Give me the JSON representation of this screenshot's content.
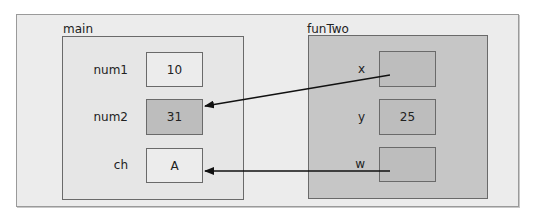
{
  "frames": {
    "main": {
      "title": "main",
      "vars": [
        {
          "name": "num1",
          "value": "10"
        },
        {
          "name": "num2",
          "value": "31"
        },
        {
          "name": "ch",
          "value": "A"
        }
      ]
    },
    "funTwo": {
      "title": "funTwo",
      "vars": [
        {
          "name": "x",
          "value": ""
        },
        {
          "name": "y",
          "value": "25"
        },
        {
          "name": "w",
          "value": ""
        }
      ]
    }
  },
  "arrows": [
    {
      "from": "funTwo.x",
      "to": "main.num2"
    },
    {
      "from": "funTwo.w",
      "to": "main.ch"
    }
  ],
  "colors": {
    "background": "#ececec",
    "main_frame": "#e6e6e6",
    "fun_frame": "#c6c6c6",
    "highlight_cell": "#bdbdbd",
    "border": "#6a6a6a"
  }
}
